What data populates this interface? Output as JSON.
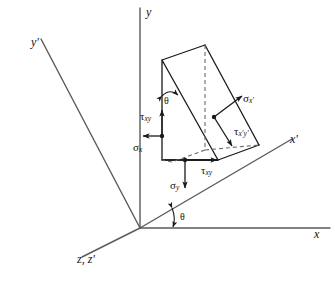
{
  "figure": {
    "type": "stress-transformation-wedge-diagram",
    "colors": {
      "line": "#1a1a1a",
      "dashed": "#555555",
      "axis": "#555555",
      "background": "#ffffff",
      "text": "#111111"
    }
  },
  "axes": [
    {
      "id": "y",
      "label": "y",
      "prime": "",
      "name": "y-axis"
    },
    {
      "id": "yp",
      "label": "y",
      "prime": "'",
      "name": "y-prime-axis"
    },
    {
      "id": "xp",
      "label": "x",
      "prime": "'",
      "name": "x-prime-axis"
    },
    {
      "id": "x",
      "label": "x",
      "prime": "",
      "name": "x-axis"
    },
    {
      "id": "zzp",
      "label": "z, z",
      "prime": "'",
      "name": "z-and-z-prime-axis"
    }
  ],
  "axis_labels": {
    "y": "y",
    "y_prime": "y'",
    "x_prime": "x'",
    "x": "x",
    "z_z_prime": "z, z'"
  },
  "stresses": [
    {
      "id": "tau_xy_left",
      "symbol": "τ",
      "subscript": "xy",
      "label": "τxy",
      "arrow": "up",
      "name": "tau-xy-left-label"
    },
    {
      "id": "sigma_x",
      "symbol": "σ",
      "subscript": "x",
      "label": "σx",
      "arrow": "left",
      "name": "sigma-x-label"
    },
    {
      "id": "sigma_y",
      "symbol": "σ",
      "subscript": "y",
      "label": "σy",
      "arrow": "down",
      "name": "sigma-y-label"
    },
    {
      "id": "tau_xy_bottom",
      "symbol": "τ",
      "subscript": "xy",
      "label": "τxy",
      "arrow": "right",
      "name": "tau-xy-bottom-label"
    },
    {
      "id": "sigma_xp",
      "symbol": "σ",
      "subscript": "x'",
      "label": "σx'",
      "arrow": "up-right",
      "name": "sigma-x-prime-label"
    },
    {
      "id": "tau_xpyp",
      "symbol": "τ",
      "subscript": "x'y'",
      "label": "τx'y'",
      "arrow": "down-right",
      "name": "tau-x-prime-y-prime-label"
    }
  ],
  "angles": [
    {
      "id": "theta_top",
      "label": "θ",
      "name": "theta-angle-top",
      "location": "between y-axis direction and inclined wedge face"
    },
    {
      "id": "theta_origin",
      "label": "θ",
      "name": "theta-angle-origin",
      "location": "between x-axis and x-prime axis at origin"
    }
  ],
  "symbols": {
    "theta": "θ",
    "sigma": "σ",
    "tau": "τ",
    "prime": "'"
  }
}
